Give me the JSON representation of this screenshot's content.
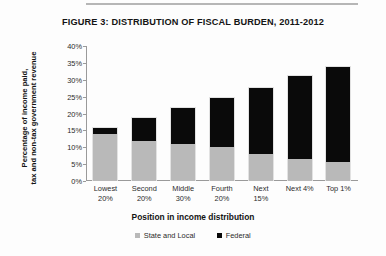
{
  "figure": {
    "title": "FIGURE 3: DISTRIBUTION OF FISCAL BURDEN, 2011-2012"
  },
  "axis": {
    "ylabel_line1": "Percentage of income paid,",
    "ylabel_line2": "tax and non-tax government revenue",
    "xlabel": "Position in income distribution"
  },
  "legend": {
    "items": [
      {
        "label": "State and Local",
        "color": "#b9b9b9"
      },
      {
        "label": "Federal",
        "color": "#0a0a0a"
      }
    ]
  },
  "chart_data": {
    "type": "bar",
    "title": "FIGURE 3: DISTRIBUTION OF FISCAL BURDEN, 2011-2012",
    "xlabel": "Position in income distribution",
    "ylabel": "Percentage of income paid, tax and non-tax government revenue",
    "stacked": true,
    "grid": false,
    "legend_position": "bottom",
    "ylim": [
      0,
      40
    ],
    "ytick_labels": [
      "40%",
      "35%",
      "30%",
      "25%",
      "20%",
      "15%",
      "10%",
      "5%",
      "0%"
    ],
    "ytick_values": [
      40,
      35,
      30,
      25,
      20,
      15,
      10,
      5,
      0
    ],
    "categories": [
      "Lowest 20%",
      "Second 20%",
      "Middle 30%",
      "Fourth 20%",
      "Next 15%",
      "Next 4%",
      "Top 1%"
    ],
    "category_lines": [
      [
        "Lowest",
        "20%"
      ],
      [
        "Second",
        "20%"
      ],
      [
        "Middle",
        "30%"
      ],
      [
        "Fourth",
        "20%"
      ],
      [
        "Next",
        "15%"
      ],
      [
        "Next 4%",
        ""
      ],
      [
        "Top 1%",
        ""
      ]
    ],
    "series": [
      {
        "name": "State and Local",
        "color": "#b9b9b9",
        "values": [
          14.0,
          12.0,
          11.0,
          10.0,
          8.0,
          6.5,
          5.5
        ]
      },
      {
        "name": "Federal",
        "color": "#0a0a0a",
        "values": [
          2.0,
          7.0,
          11.0,
          15.0,
          20.0,
          25.0,
          28.5
        ]
      }
    ],
    "totals": [
      16.0,
      19.0,
      22.0,
      25.0,
      28.0,
      31.5,
      34.0
    ]
  }
}
